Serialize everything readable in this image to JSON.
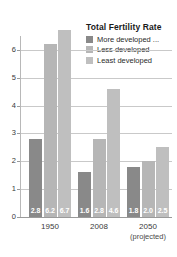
{
  "chart_data": {
    "type": "bar",
    "title": "Total Fertility Rate",
    "xlabel": "",
    "ylabel": "",
    "ylim": [
      0,
      6.5
    ],
    "yticks": [
      0,
      1,
      2,
      3,
      4,
      5,
      6
    ],
    "grid": true,
    "legend_position": "top-right",
    "categories": [
      "1950",
      "2008",
      "2050"
    ],
    "category_sublabels": [
      "",
      "",
      "(projected)"
    ],
    "series": [
      {
        "name": "More developed ...",
        "color": "#898989",
        "values": [
          2.8,
          1.6,
          1.8
        ]
      },
      {
        "name": "Less developed",
        "color": "#b6b6b6",
        "values": [
          6.2,
          2.8,
          2.0
        ]
      },
      {
        "name": "Least developed",
        "color": "#bfbfbf",
        "values": [
          6.7,
          4.6,
          2.5
        ]
      }
    ],
    "value_labels": [
      [
        "2.8",
        "6.2",
        "6.7"
      ],
      [
        "1.6",
        "2.8",
        "4.6"
      ],
      [
        "1.8",
        "2.0",
        "2.5"
      ]
    ],
    "ytick_labels": [
      "0",
      "1",
      "2",
      "3",
      "4",
      "5",
      "6"
    ]
  }
}
